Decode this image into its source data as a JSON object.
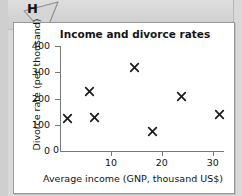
{
  "marker": {
    "label": "H",
    "name": "annotation-marker-h"
  },
  "chart_data": {
    "type": "scatter",
    "title": "Income and divorce rates",
    "xlabel": "Average income (GNP, thousand US$)",
    "ylabel": "Divorce rate (per thousand)",
    "xlim": [
      0,
      32
    ],
    "ylim": [
      0,
      400
    ],
    "xticks": [
      0,
      10,
      20,
      30
    ],
    "yticks": [
      0,
      100,
      200,
      300,
      400
    ],
    "xtick_labels": [
      "0",
      "10",
      "20",
      "30"
    ],
    "ytick_labels": [
      "0",
      "100",
      "200",
      "300",
      "400"
    ],
    "grid": false,
    "legend": null,
    "marker_style": "x",
    "marker_color": "#1a1a1a",
    "points": [
      {
        "x": 1.4,
        "y": 127
      },
      {
        "x": 5.7,
        "y": 232
      },
      {
        "x": 6.8,
        "y": 130
      },
      {
        "x": 14.7,
        "y": 322
      },
      {
        "x": 18.1,
        "y": 78
      },
      {
        "x": 23.8,
        "y": 212
      },
      {
        "x": 31.4,
        "y": 142
      }
    ]
  }
}
